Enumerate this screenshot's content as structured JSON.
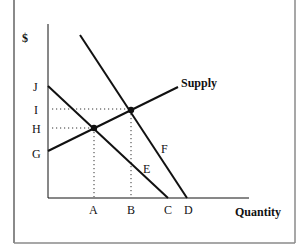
{
  "diagram": {
    "type": "supply-demand",
    "y_axis_label": "$",
    "x_axis_label": "Quantity",
    "price_labels": [
      "J",
      "I",
      "H",
      "G"
    ],
    "quantity_labels": [
      "A",
      "B",
      "C",
      "D"
    ],
    "curve_labels": {
      "supply": "Supply",
      "demand_lower_point": "E",
      "demand_upper_point": "F"
    },
    "colors": {
      "line": "#111111",
      "border": "#8a8a8a",
      "background": "#ffffff"
    }
  }
}
